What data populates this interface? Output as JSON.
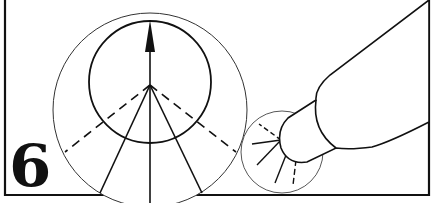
{
  "figure": {
    "step_number": "6",
    "colors": {
      "ink": "#111111",
      "background": "#ffffff"
    },
    "elements": {
      "frame": "step-frame",
      "magnified_view": "large-circle-detail",
      "spray_cone": "spray-pattern",
      "direction_arrow": "arrow-up-icon",
      "nozzle": "nozzle-tip",
      "small_view": "small-circle-detail"
    }
  }
}
